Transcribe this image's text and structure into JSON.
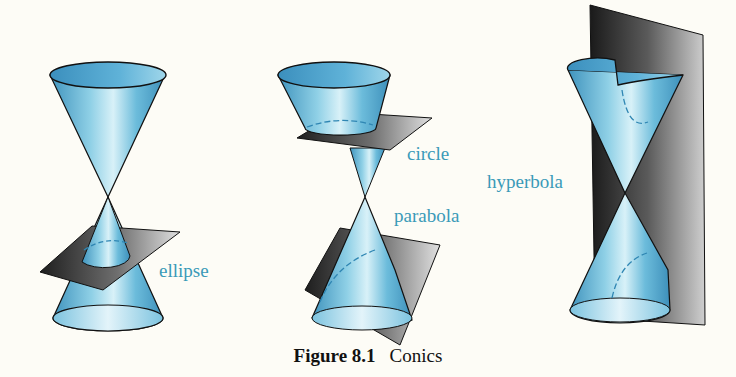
{
  "figure": {
    "number": "Figure 8.1",
    "title": "Conics",
    "colors": {
      "cone": "#5fb3d6",
      "cone_light": "#bfe3f0",
      "plane_dark": "#2a2a2a",
      "plane_light": "#d8d8d8",
      "label": "#3a9ab8",
      "background": "#fdfcf6"
    },
    "panels": [
      {
        "id": "ellipse",
        "labels": [
          "ellipse"
        ]
      },
      {
        "id": "circle-parabola",
        "labels": [
          "circle",
          "parabola"
        ]
      },
      {
        "id": "hyperbola",
        "labels": [
          "hyperbola"
        ]
      }
    ]
  }
}
